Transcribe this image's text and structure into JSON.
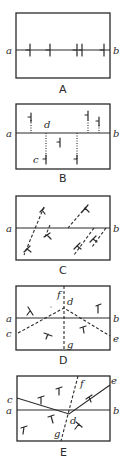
{
  "panels": [
    {
      "caption": "A",
      "labels": {
        "a": "a",
        "b": "b"
      },
      "description": "Horizontal line a-b with strike/dip symbols along the line"
    },
    {
      "caption": "B",
      "labels": {
        "a": "a",
        "b": "b",
        "c": "c",
        "d": "d"
      },
      "description": "Line a-b with symbols offset above and below via dotted vertical projections"
    },
    {
      "caption": "C",
      "labels": {
        "a": "a",
        "b": "b"
      },
      "description": "Line a-b crossed by oblique dashed lines with strike/dip symbols"
    },
    {
      "caption": "D",
      "labels": {
        "a": "a",
        "b": "b",
        "c": "c",
        "d": "d",
        "e": "e",
        "f": "f",
        "g": "g"
      },
      "description": "Line a-b, dashed anticline-like trace c-d-e, vertical dashed f-g through d"
    },
    {
      "caption": "E",
      "labels": {
        "a": "a",
        "b": "b",
        "c": "c",
        "d": "d",
        "e": "e",
        "f": "f",
        "g": "g"
      },
      "description": "Line a-b, solid trace c-d-e, inclined dashed f-g through d"
    }
  ]
}
